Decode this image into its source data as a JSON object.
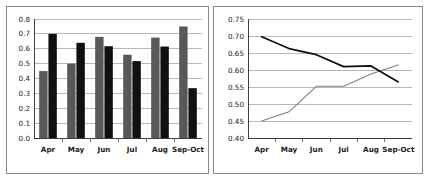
{
  "figure": {
    "background_color": "#ffffff",
    "panel_border_color": "#8a8a8a"
  },
  "chart_data": [
    {
      "id": "left",
      "type": "bar",
      "title": "",
      "subtitle": "",
      "xlabel": "",
      "ylabel": "",
      "categories": [
        "Apr",
        "May",
        "Jun",
        "Jul",
        "Aug",
        "Sep-Oct"
      ],
      "series": [
        {
          "name": "Series 1",
          "color": "#585858",
          "values": [
            0.45,
            0.5,
            0.68,
            0.56,
            0.675,
            0.75
          ]
        },
        {
          "name": "Series 2",
          "color": "#101010",
          "values": [
            0.7,
            0.64,
            0.617,
            0.517,
            0.615,
            0.335
          ]
        }
      ],
      "ylim": [
        0.0,
        0.8
      ],
      "ytick_step": 0.1,
      "yticks": [
        "0.0",
        "0.1",
        "0.2",
        "0.3",
        "0.4",
        "0.5",
        "0.6",
        "0.7",
        "0.8"
      ],
      "ytick_values": [
        0.0,
        0.1,
        0.2,
        0.3,
        0.4,
        0.5,
        0.6,
        0.7,
        0.8
      ],
      "xticks": [
        "Apr",
        "May",
        "Jun",
        "Jul",
        "Aug",
        "Sep-Oct"
      ],
      "grid": true,
      "grid_axis": "y",
      "legend": false,
      "legend_position": "none"
    },
    {
      "id": "right",
      "type": "line",
      "title": "",
      "subtitle": "",
      "xlabel": "",
      "ylabel": "",
      "categories": [
        "Apr",
        "May",
        "Jun",
        "Jul",
        "Aug",
        "Sep-Oct"
      ],
      "x": [
        "Apr",
        "May",
        "Jun",
        "Jul",
        "Aug",
        "Sep-Oct"
      ],
      "series": [
        {
          "name": "Series 1",
          "color": "#808080",
          "values": [
            0.45,
            0.477,
            0.552,
            0.552,
            0.588,
            0.615
          ]
        },
        {
          "name": "Series 2",
          "color": "#0d0d0d",
          "values": [
            0.698,
            0.663,
            0.645,
            0.61,
            0.612,
            0.565
          ]
        }
      ],
      "ylim": [
        0.4,
        0.75
      ],
      "ytick_step": 0.05,
      "yticks": [
        "0.40",
        "0.45",
        "0.50",
        "0.55",
        "0.60",
        "0.65",
        "0.70",
        "0.75"
      ],
      "ytick_values": [
        0.4,
        0.45,
        0.5,
        0.55,
        0.6,
        0.65,
        0.7,
        0.75
      ],
      "xticks": [
        "Apr",
        "May",
        "Jun",
        "Jul",
        "Aug",
        "Sep-Oct"
      ],
      "grid": true,
      "grid_axis": "y",
      "legend": false,
      "legend_position": "none"
    }
  ]
}
